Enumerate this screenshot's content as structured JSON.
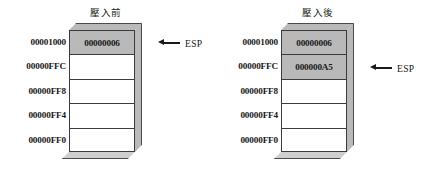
{
  "diagrams": [
    {
      "id": "before",
      "title": "壓入前",
      "addresses": [
        "00001000",
        "00000FFC",
        "00000FF8",
        "00000FF4",
        "00000FF0"
      ],
      "cells": [
        {
          "value": "00000006",
          "filled": true
        },
        {
          "value": "",
          "filled": false
        },
        {
          "value": "",
          "filled": false
        },
        {
          "value": "",
          "filled": false
        },
        {
          "value": "",
          "filled": false
        }
      ],
      "pointer": {
        "label": "ESP",
        "icon": "left-arrow-icon",
        "row_index": 0
      }
    },
    {
      "id": "after",
      "title": "壓入後",
      "addresses": [
        "00001000",
        "00000FFC",
        "00000FF8",
        "00000FF4",
        "00000FF0"
      ],
      "cells": [
        {
          "value": "00000006",
          "filled": true
        },
        {
          "value": "000000A5",
          "filled": true
        },
        {
          "value": "",
          "filled": false
        },
        {
          "value": "",
          "filled": false
        },
        {
          "value": "",
          "filled": false
        }
      ],
      "pointer": {
        "label": "ESP",
        "icon": "left-arrow-icon",
        "row_index": 1
      }
    }
  ],
  "colors": {
    "filled_cell": "#b9b9b9",
    "box_side": "#b9b9b9",
    "box_bottom": "#cfcfcf",
    "outline": "#3c3c3c",
    "text": "#1a1a1a",
    "background": "#ffffff"
  }
}
